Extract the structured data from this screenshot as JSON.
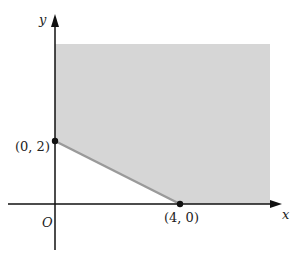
{
  "diagram": {
    "type": "feasible-region-plot",
    "axes": {
      "x_label": "x",
      "y_label": "y",
      "origin_label": "O"
    },
    "points": [
      {
        "label": "(0, 2)",
        "x": 0,
        "y": 2
      },
      {
        "label": "(4, 0)",
        "x": 4,
        "y": 0
      }
    ],
    "boundary_line": {
      "from": "(0, 2)",
      "to": "(4, 0)",
      "equation": "x + 2y = 4"
    },
    "region": {
      "description": "unbounded shaded region in first quadrant above/right of line x + 2y = 4",
      "fill": "#d6d6d6"
    },
    "colors": {
      "axis": "#111111",
      "region_fill": "#d6d6d6",
      "boundary": "#9a9a9a",
      "point": "#111111"
    }
  }
}
